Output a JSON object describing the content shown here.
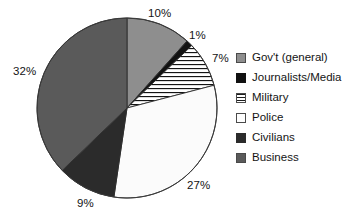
{
  "chart_data": {
    "type": "pie",
    "title": "",
    "labels": [
      "Gov't (general)",
      "Journalists/Media",
      "Military",
      "Police",
      "Civilians",
      "Business"
    ],
    "values": [
      10,
      1,
      7,
      27,
      9,
      32
    ],
    "value_suffix": "%",
    "data_labels": [
      "10%",
      "1%",
      "7%",
      "27%",
      "9%",
      "32%"
    ],
    "legend_position": "right",
    "grid": false,
    "start_angle_deg": 0,
    "direction": "clockwise",
    "colors": [
      "#8e8e8e",
      "#111111",
      "#ffffff",
      "#fdfdfd",
      "#2b2b2b",
      "#5a5a5a"
    ],
    "fill_patterns": [
      "solid",
      "solid",
      "horizontal-lines",
      "solid",
      "solid",
      "solid"
    ]
  },
  "slices": [
    {
      "key": "gov",
      "label": "Gov't (general)",
      "value": 10,
      "data_label": "10%",
      "label_x": 148,
      "label_y": 8,
      "swatch": "sw-gov"
    },
    {
      "key": "journ",
      "label": "Journalists/Media",
      "value": 1,
      "data_label": "1%",
      "label_x": 189,
      "label_y": 30,
      "swatch": "sw-journ"
    },
    {
      "key": "mil",
      "label": "Military",
      "value": 7,
      "data_label": "7%",
      "label_x": 212,
      "label_y": 53,
      "swatch": "sw-mil"
    },
    {
      "key": "police",
      "label": "Police",
      "value": 27,
      "data_label": "27%",
      "label_x": 187,
      "label_y": 180,
      "swatch": "sw-police"
    },
    {
      "key": "civ",
      "label": "Civilians",
      "value": 9,
      "data_label": "9%",
      "label_x": 77,
      "label_y": 198,
      "swatch": "sw-civ"
    },
    {
      "key": "bus",
      "label": "Business",
      "value": 32,
      "data_label": "32%",
      "label_x": 13,
      "label_y": 66,
      "swatch": "sw-bus"
    }
  ],
  "legend": {
    "items": [
      {
        "label": "Gov't (general)"
      },
      {
        "label": "Journalists/Media"
      },
      {
        "label": "Military"
      },
      {
        "label": "Police"
      },
      {
        "label": "Civilians"
      },
      {
        "label": "Business"
      }
    ]
  }
}
